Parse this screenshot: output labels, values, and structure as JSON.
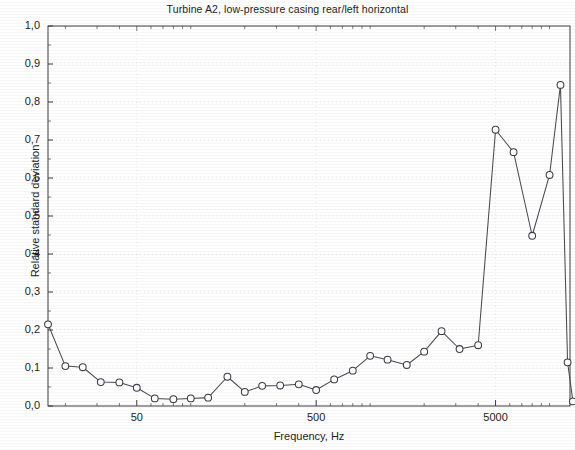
{
  "chart_data": {
    "type": "line",
    "title": "Turbine A2, low-pressure casing rear/left horizontal",
    "xlabel": "Frequency, Hz",
    "ylabel": "Relative standard deviation",
    "xscale": "log",
    "xlim": [
      16,
      13000
    ],
    "ylim": [
      0.0,
      1.0
    ],
    "grid": true,
    "legend": "none",
    "x_tick_labels": [
      "50",
      "500",
      "5000"
    ],
    "x_tick_values": [
      50,
      500,
      5000
    ],
    "y_tick_labels": [
      "0,0",
      "0,1",
      "0,2",
      "0,3",
      "0,4",
      "0,5",
      "0,6",
      "0,7",
      "0,8",
      "0,9",
      "1,0"
    ],
    "y_tick_values": [
      0.0,
      0.1,
      0.2,
      0.3,
      0.4,
      0.5,
      0.6,
      0.7,
      0.8,
      0.9,
      1.0
    ],
    "decimal_separator": ",",
    "marker": "open-circle",
    "x": [
      16,
      20,
      25,
      31.5,
      40,
      50,
      63,
      80,
      100,
      125,
      160,
      200,
      250,
      315,
      400,
      500,
      630,
      800,
      1000,
      1250,
      1600,
      2000,
      2500,
      3150,
      4000,
      5000,
      6300,
      8000,
      10000
    ],
    "series": [
      {
        "name": "Relative standard deviation",
        "values": [
          0.215,
          0.105,
          0.102,
          0.063,
          0.062,
          0.048,
          0.02,
          0.018,
          0.02,
          0.022,
          0.077,
          0.037,
          0.053,
          0.054,
          0.057,
          0.042,
          0.07,
          0.093,
          0.132,
          0.122,
          0.108,
          0.143,
          0.197,
          0.15,
          0.16,
          0.727,
          0.668,
          0.448,
          0.608
        ]
      }
    ],
    "points": [
      {
        "x": 16,
        "y": 0.215
      },
      {
        "x": 20,
        "y": 0.105
      },
      {
        "x": 25,
        "y": 0.102
      },
      {
        "x": 31.5,
        "y": 0.063
      },
      {
        "x": 40,
        "y": 0.062
      },
      {
        "x": 50,
        "y": 0.048
      },
      {
        "x": 63,
        "y": 0.02
      },
      {
        "x": 80,
        "y": 0.018
      },
      {
        "x": 100,
        "y": 0.02
      },
      {
        "x": 125,
        "y": 0.022
      },
      {
        "x": 160,
        "y": 0.077
      },
      {
        "x": 200,
        "y": 0.037
      },
      {
        "x": 250,
        "y": 0.053
      },
      {
        "x": 315,
        "y": 0.054
      },
      {
        "x": 400,
        "y": 0.057
      },
      {
        "x": 500,
        "y": 0.042
      },
      {
        "x": 630,
        "y": 0.07
      },
      {
        "x": 800,
        "y": 0.093
      },
      {
        "x": 1000,
        "y": 0.132
      },
      {
        "x": 1250,
        "y": 0.122
      },
      {
        "x": 1600,
        "y": 0.108
      },
      {
        "x": 2000,
        "y": 0.143
      },
      {
        "x": 2500,
        "y": 0.197
      },
      {
        "x": 3150,
        "y": 0.15
      },
      {
        "x": 4000,
        "y": 0.16
      },
      {
        "x": 5000,
        "y": 0.727
      },
      {
        "x": 6300,
        "y": 0.668
      },
      {
        "x": 8000,
        "y": 0.448
      },
      {
        "x": 10000,
        "y": 0.608
      },
      {
        "x": 11500,
        "y": 0.845
      },
      {
        "x": 12600,
        "y": 0.115
      },
      {
        "x": 13500,
        "y": 0.012
      }
    ],
    "annotations": [],
    "colors": {
      "line": "#4a4a55",
      "marker_fill": "#ffffff",
      "marker_stroke": "#3d3d48",
      "axis": "#3c3c3c",
      "grid": "#d8d8d8",
      "background": "#ffffff"
    }
  }
}
